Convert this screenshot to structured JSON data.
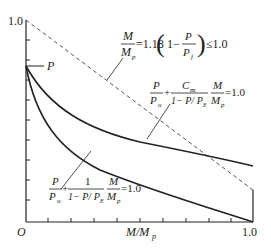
{
  "axes": {
    "origin_label": "O",
    "y_top_label": "1.0",
    "x_right_label": "1.0",
    "x_axis_label": "M/M",
    "x_axis_label_sub": "p",
    "y_axis_point_label": "P"
  },
  "equations": {
    "dashed": {
      "lhs_num": "M",
      "lhs_den": "M",
      "lhs_den_sub": "p",
      "middle": "=1.18",
      "inner_one": "1−",
      "inner_num": "P",
      "inner_den": "P",
      "inner_den_sub": "f",
      "rhs": "≤1.0"
    },
    "upper": {
      "t1_num": "P",
      "t1_den": "P",
      "t1_den_sub": "u",
      "plus": "+",
      "t2_num": "C",
      "t2_num_sub": "m",
      "t2_den": "1− P/ P",
      "t2_den_sub": "E",
      "t3_num": "M",
      "t3_den": "M",
      "t3_den_sub": "p",
      "rhs": "=1.0"
    },
    "lower": {
      "t1_num": "P",
      "t1_den": "P",
      "t1_den_sub": "u",
      "plus": "+",
      "t2_num": "1",
      "t2_den": "1− P/ P",
      "t2_den_sub": "E",
      "t3_num": "M",
      "t3_den": "M",
      "t3_den_sub": "p",
      "rhs": "=1.0"
    }
  },
  "colors": {
    "line": "#222222",
    "dashed": "#555555",
    "background": "#ffffff"
  }
}
